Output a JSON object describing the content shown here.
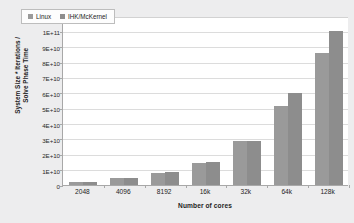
{
  "chart_data": {
    "type": "bar",
    "title": "",
    "xlabel": "Number of cores",
    "ylabel_lines": [
      "System Size * Iterations /",
      "Solve Phase Time"
    ],
    "ylabel": "System Size * Iterations / Solve Phase Time",
    "categories": [
      "2048",
      "4096",
      "8192",
      "16k",
      "32k",
      "64k",
      "128k"
    ],
    "series": [
      {
        "name": "Linux",
        "color": "#9a9a9a",
        "values": [
          2000000000,
          4300000000,
          8000000000,
          14300000000,
          28500000000,
          51500000000,
          86000000000
        ]
      },
      {
        "name": "IHK/McKernel",
        "color": "#8d8d8d",
        "values": [
          2200000000,
          4500000000,
          8700000000,
          15200000000,
          28400000000,
          60000000000,
          100500000000
        ]
      }
    ],
    "ylim": [
      0,
      110000000000
    ],
    "ytick_values": [
      0,
      10000000000,
      20000000000,
      30000000000,
      40000000000,
      50000000000,
      60000000000,
      70000000000,
      80000000000,
      90000000000,
      100000000000,
      110000000000
    ],
    "ytick_labels": [
      "0",
      "1E+10",
      "2E+10",
      "3E+10",
      "4E+10",
      "5E+10",
      "6E+10",
      "7E+10",
      "8E+10",
      "9E+10",
      "1E+11",
      "1.1E+11"
    ],
    "grid": true,
    "legend_position": "top-left-inside",
    "legend_entries": [
      "Linux",
      "IHK/McKernel"
    ],
    "background": "#ededee",
    "plot_background": "#ffffff",
    "gridline_color": "#dcdcdc",
    "axis_color": "#a8a8a8"
  }
}
